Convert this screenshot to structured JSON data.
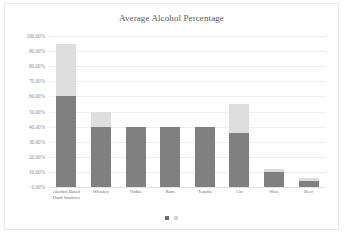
{
  "chart_data": {
    "type": "bar",
    "title": "Average Alcohol Percentage",
    "xlabel": "",
    "ylabel": "",
    "ylim": [
      0,
      100
    ],
    "grid": true,
    "legend": "none",
    "stacked": true,
    "categories": [
      "Alcohol Based Hand Sanitizer",
      "Whiskey",
      "Vodka",
      "Rum",
      "Tequila",
      "Gin",
      "Wine",
      "Beer"
    ],
    "category_lines": [
      [
        "Alcohol Based",
        "Hand Sanitizer"
      ],
      [
        "Whiskey"
      ],
      [
        "Vodka"
      ],
      [
        "Rum"
      ],
      [
        "Tequila"
      ],
      [
        "Gin"
      ],
      [
        "Wine"
      ],
      [
        "Beer"
      ]
    ],
    "series": [
      {
        "name": "minimum",
        "color": "#808080",
        "values": [
          60,
          40,
          40,
          40,
          40,
          36,
          10,
          4
        ]
      },
      {
        "name": "maximum",
        "color": "#dedede",
        "values": [
          95,
          50,
          40,
          40,
          40,
          55,
          12,
          6
        ]
      }
    ],
    "y_ticks": [
      "100.00%",
      "90.00%",
      "80.00%",
      "70.00%",
      "60.00%",
      "50.00%",
      "40.00%",
      "30.00%",
      "20.00%",
      "10.00%",
      "0.00%"
    ],
    "y_tick_values": [
      100,
      90,
      80,
      70,
      60,
      50,
      40,
      30,
      20,
      10,
      0
    ]
  },
  "pagination": {
    "dots": 2,
    "active_index": 0
  },
  "colors": {
    "bar_dark": "#808080",
    "bar_light": "#dedede",
    "gridline": "#ededed",
    "text": "#6f6f6f",
    "title": "#5a5a5a",
    "card_border": "#e8e8e8",
    "background": "#ffffff"
  }
}
